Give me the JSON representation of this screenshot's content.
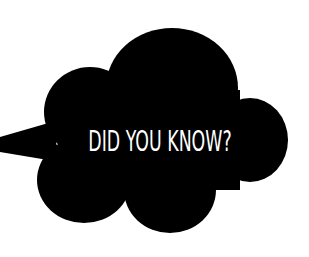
{
  "graphic": {
    "headline": "DID YOU KNOW?",
    "shape": "speech-cloud",
    "colors": {
      "background": "#ffffff",
      "cloud_fill": "#000000",
      "text": "#ffffff"
    }
  }
}
